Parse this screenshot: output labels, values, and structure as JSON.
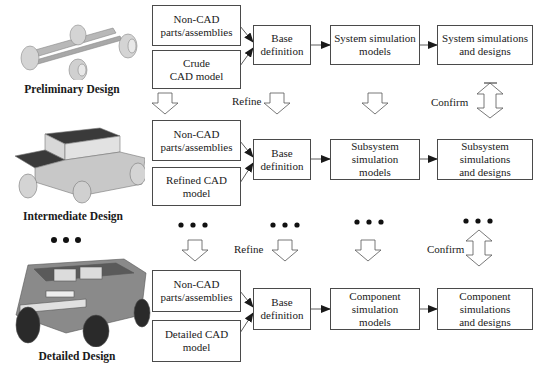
{
  "stages": [
    {
      "name": "Preliminary Design",
      "inputs": [
        "Non-CAD\nparts/assemblies",
        "Crude\nCAD model"
      ],
      "base": "Base\ndefinition",
      "models": "System simulation\nmodels",
      "results": "System simulations\nand designs"
    },
    {
      "name": "Intermediate Design",
      "inputs": [
        "Non-CAD\nparts/assemblies",
        "Refined CAD\nmodel"
      ],
      "base": "Base\ndefinition",
      "models": "Subsystem simulation\nmodels",
      "results": "Subsystem simulations\nand designs"
    },
    {
      "name": "Detailed Design",
      "inputs": [
        "Non-CAD\nparts/assemblies",
        "Detailed CAD\nmodel"
      ],
      "base": "Base\ndefinition",
      "models": "Component simulation\nmodels",
      "results": "Component simulations\nand designs"
    }
  ],
  "transitions": {
    "refine_label": "Refine",
    "confirm_label": "Confirm"
  },
  "icons": {
    "refine_arrow": "hollow-down-arrow",
    "confirm_arrow": "hollow-double-arrow",
    "continuation": "ellipsis-dots"
  },
  "colors": {
    "box_border": "#4a4a4a",
    "arrow_fill": "#1a1a1a",
    "vehicle_body": "#c8c8c8",
    "vehicle_dark": "#3a3a3a"
  }
}
